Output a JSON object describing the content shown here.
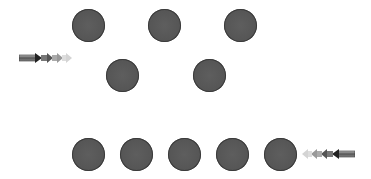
{
  "diagram": {
    "description": "Arrangement of dark gray circles in three rows with two shaded arrows",
    "dot_color": "#555555",
    "dot_radius": 16,
    "rows": [
      {
        "name": "top",
        "dots": [
          {
            "x": 88,
            "y": 25
          },
          {
            "x": 164,
            "y": 25
          },
          {
            "x": 240,
            "y": 25
          }
        ]
      },
      {
        "name": "middle",
        "dots": [
          {
            "x": 122,
            "y": 75
          },
          {
            "x": 210,
            "y": 75
          }
        ]
      },
      {
        "name": "bottom",
        "dots": [
          {
            "x": 88,
            "y": 154
          },
          {
            "x": 136,
            "y": 154
          },
          {
            "x": 184,
            "y": 154
          },
          {
            "x": 232,
            "y": 154
          },
          {
            "x": 280,
            "y": 154
          }
        ]
      }
    ],
    "arrows": [
      {
        "name": "right-arrow",
        "direction": "right",
        "x": 19,
        "y": 52,
        "width": 54,
        "height": 12
      },
      {
        "name": "left-arrow",
        "direction": "left",
        "x": 301,
        "y": 148,
        "width": 54,
        "height": 12
      }
    ]
  }
}
